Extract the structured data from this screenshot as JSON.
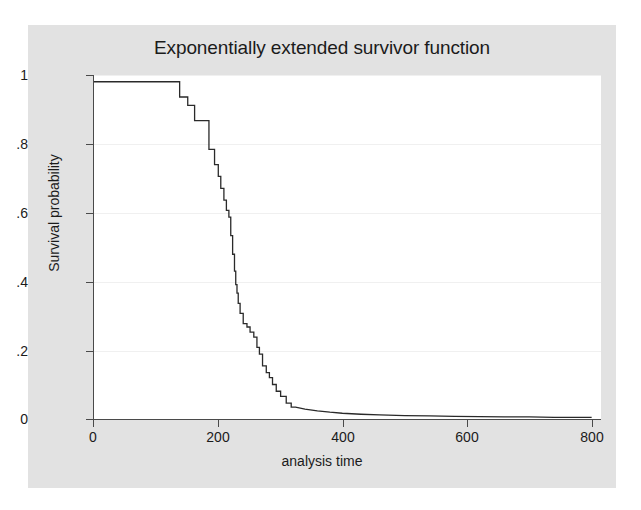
{
  "figure": {
    "background": "#ffffff",
    "panel_background": "#e2e2e2",
    "plot_background": "#ffffff",
    "axis_color": "#4a4a4a",
    "grid_color": "#f0f0f0",
    "line_color": "#2a2a2a"
  },
  "chart_data": {
    "type": "line",
    "title": "Exponentially extended survivor function",
    "xlabel": "analysis time",
    "ylabel": "Survival probability",
    "xlim": [
      0,
      815
    ],
    "ylim": [
      0,
      1.02
    ],
    "xticks": [
      0,
      200,
      400,
      600,
      800
    ],
    "xticklabels": [
      "0",
      "200",
      "400",
      "600",
      "800"
    ],
    "yticks": [
      0,
      0.2,
      0.4,
      0.6,
      0.8,
      1
    ],
    "yticklabels": [
      "0",
      ".2",
      ".4",
      ".6",
      ".8",
      "1"
    ],
    "grid": "horizontal",
    "legend": "none",
    "series": [
      {
        "name": "Exponentially extended survivor function",
        "style": "step-then-smooth",
        "x": [
          0,
          139,
          139,
          152,
          152,
          163,
          163,
          172,
          172,
          186,
          186,
          195,
          195,
          201,
          201,
          205,
          205,
          210,
          210,
          214,
          214,
          218,
          218,
          221,
          221,
          224,
          224,
          227,
          227,
          229,
          229,
          231,
          231,
          233,
          233,
          236,
          236,
          241,
          241,
          247,
          247,
          252,
          252,
          258,
          258,
          263,
          263,
          267,
          267,
          272,
          272,
          278,
          278,
          283,
          283,
          288,
          288,
          294,
          294,
          301,
          301,
          310,
          310,
          318,
          318,
          325,
          340,
          360,
          380,
          400,
          430,
          460,
          500,
          540,
          580,
          620,
          660,
          700,
          740,
          780,
          800
        ],
        "y": [
          1.0,
          1.0,
          0.955,
          0.955,
          0.93,
          0.93,
          0.885,
          0.885,
          0.885,
          0.885,
          0.8,
          0.8,
          0.755,
          0.755,
          0.72,
          0.72,
          0.685,
          0.685,
          0.65,
          0.65,
          0.62,
          0.62,
          0.6,
          0.6,
          0.545,
          0.545,
          0.49,
          0.49,
          0.44,
          0.44,
          0.4,
          0.4,
          0.375,
          0.375,
          0.345,
          0.345,
          0.315,
          0.315,
          0.285,
          0.285,
          0.275,
          0.275,
          0.26,
          0.26,
          0.245,
          0.245,
          0.215,
          0.215,
          0.195,
          0.195,
          0.16,
          0.16,
          0.14,
          0.14,
          0.125,
          0.125,
          0.105,
          0.105,
          0.085,
          0.085,
          0.07,
          0.07,
          0.05,
          0.05,
          0.038,
          0.038,
          0.032,
          0.027,
          0.023,
          0.02,
          0.017,
          0.015,
          0.013,
          0.012,
          0.011,
          0.01,
          0.009,
          0.009,
          0.008,
          0.008,
          0.008
        ]
      }
    ]
  }
}
